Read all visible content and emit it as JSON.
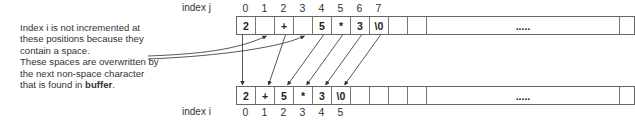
{
  "note": {
    "line1": "Index i is not incremented at these positions because they contain a space.",
    "line2_prefix": "These spaces are overwritten by the next non-space character that is found in ",
    "line2_bold": "buffer",
    "line2_suffix": "."
  },
  "top_array": {
    "index_label": "index j",
    "indices": [
      "0",
      "1",
      "2",
      "3",
      "4",
      "5",
      "6",
      "7"
    ],
    "cells": [
      "2",
      "",
      "+",
      "",
      "5",
      "*",
      "3",
      "\\0",
      "",
      "",
      ".....",
      ""
    ]
  },
  "bottom_array": {
    "index_label": "index i",
    "indices": [
      "0",
      "1",
      "2",
      "3",
      "4",
      "5"
    ],
    "cells": [
      "2",
      "+",
      "5",
      "*",
      "3",
      "\\0",
      "",
      "",
      "",
      "",
      ".....",
      ""
    ]
  },
  "mapping": [
    {
      "from_j": 0,
      "to_i": 0
    },
    {
      "from_j": 2,
      "to_i": 1
    },
    {
      "from_j": 4,
      "to_i": 2
    },
    {
      "from_j": 5,
      "to_i": 3
    },
    {
      "from_j": 6,
      "to_i": 4
    },
    {
      "from_j": 7,
      "to_i": 5
    }
  ],
  "space_positions_j": [
    1,
    3
  ]
}
